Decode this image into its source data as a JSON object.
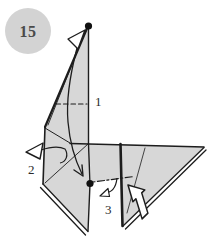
{
  "badge": {
    "number": "15"
  },
  "labels": {
    "fold1": "1",
    "fold2": "2",
    "fold3": "3"
  },
  "colors": {
    "background": "#ffffff",
    "paper": "#d7d7d7",
    "line": "#1d1d1d",
    "badge_bg": "#d3d3d3",
    "badge_text": "#4a4a4a",
    "label_text": "#2b2b2b",
    "dot": "#111111",
    "arrow_fill": "#ffffff"
  },
  "icons": {
    "swing_arrowhead_top": "open-white-arrowhead-pointing-up-right",
    "motion_path": "curved-arrow-down-along-neck",
    "pull_out_arrow": "open-white-arrowhead-pointing-left-with-hook-tail",
    "tuck_hook_arrow": "small-hook-arrow-pointing-down-left",
    "push_arrow": "thick-white-arrow-pointing-up-left",
    "alignment_dots": "black-reference-dots"
  }
}
